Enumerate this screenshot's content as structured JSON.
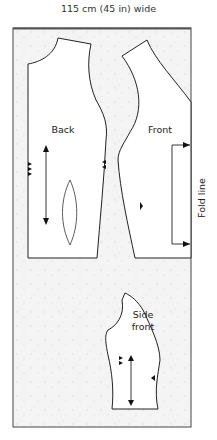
{
  "diagram": {
    "width_label": "115 cm (45 in) wide",
    "fold_label": "Fold line",
    "pieces": [
      {
        "name": "Back",
        "label": "Back"
      },
      {
        "name": "Front",
        "label": "Front"
      },
      {
        "name": "Side front",
        "label_line1": "Side",
        "label_line2": "front"
      }
    ]
  }
}
